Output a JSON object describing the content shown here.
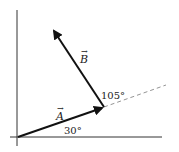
{
  "diagram": {
    "type": "vector-diagram",
    "vectors": [
      {
        "name": "A",
        "label": "A",
        "angle_label": "30°"
      },
      {
        "name": "B",
        "label": "B",
        "angle_label": "105°"
      }
    ],
    "angles": {
      "a_from_x_axis": "30°",
      "b_from_a_extension": "105°"
    },
    "colors": {
      "stroke": "#111111",
      "dashed": "#888888",
      "background": "#ffffff"
    }
  }
}
